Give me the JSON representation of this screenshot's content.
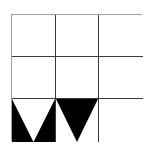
{
  "grid": {
    "rows": 3,
    "cols": 3,
    "line_color": "#3a3a3a",
    "border_color": "#a0a0a0",
    "cells": [
      {
        "row": 0,
        "col": 0,
        "pattern": "empty"
      },
      {
        "row": 0,
        "col": 1,
        "pattern": "empty"
      },
      {
        "row": 0,
        "col": 2,
        "pattern": "empty"
      },
      {
        "row": 1,
        "col": 0,
        "pattern": "empty"
      },
      {
        "row": 1,
        "col": 1,
        "pattern": "empty"
      },
      {
        "row": 1,
        "col": 2,
        "pattern": "empty"
      },
      {
        "row": 2,
        "col": 0,
        "pattern": "black-square-with-white-down-triangle"
      },
      {
        "row": 2,
        "col": 1,
        "pattern": "black-down-triangle"
      },
      {
        "row": 2,
        "col": 2,
        "pattern": "empty"
      }
    ]
  },
  "colors": {
    "fill": "#000000",
    "background": "#ffffff"
  }
}
